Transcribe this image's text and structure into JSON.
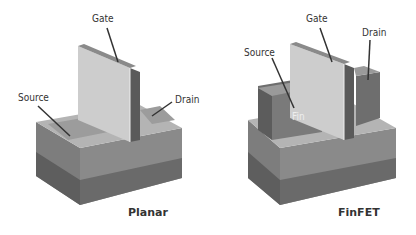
{
  "diagrams": [
    {
      "name": "planar",
      "caption": "Planar",
      "labels": {
        "gate": "Gate",
        "source": "Source",
        "drain": "Drain"
      }
    },
    {
      "name": "finfet",
      "caption": "FinFET",
      "labels": {
        "gate": "Gate",
        "source": "Source",
        "drain": "Drain",
        "fin": "Fin"
      }
    }
  ],
  "colors": {
    "top": "#b9b9b9",
    "front_light": "#8f8f8f",
    "front_dark": "#6e6e6e",
    "side_light": "#7f7f7f",
    "side_dark": "#5f5f5f",
    "gate_face": "#cfcfcf",
    "gate_edge": "#5a5a5a",
    "leader": "#333333"
  }
}
